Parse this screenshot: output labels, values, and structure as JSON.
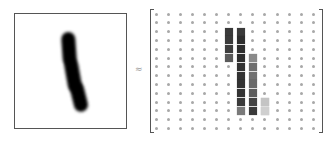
{
  "figure": {
    "left_panel": {
      "label": "handwritten digit image",
      "digit": "1"
    },
    "operator_symbol": "≈",
    "matrix": {
      "rows": 14,
      "cols": 14,
      "origin_x": 6,
      "origin_y": 5,
      "step_x": 12.1,
      "step_y": 8.8,
      "dot_color": "#a8a8a8",
      "cells": [
        {
          "r": 2,
          "c": 6,
          "shade": "#3a3a3a"
        },
        {
          "r": 2,
          "c": 7,
          "shade": "#3a3a3a"
        },
        {
          "r": 3,
          "c": 6,
          "shade": "#3a3a3a"
        },
        {
          "r": 3,
          "c": 7,
          "shade": "#2e2e2e"
        },
        {
          "r": 4,
          "c": 6,
          "shade": "#3d3d3d"
        },
        {
          "r": 4,
          "c": 7,
          "shade": "#2e2e2e"
        },
        {
          "r": 5,
          "c": 6,
          "shade": "#5a5a5a"
        },
        {
          "r": 5,
          "c": 7,
          "shade": "#2e2e2e"
        },
        {
          "r": 5,
          "c": 8,
          "shade": "#8a8a8a"
        },
        {
          "r": 6,
          "c": 7,
          "shade": "#333333"
        },
        {
          "r": 6,
          "c": 8,
          "shade": "#6e6e6e"
        },
        {
          "r": 7,
          "c": 7,
          "shade": "#333333"
        },
        {
          "r": 7,
          "c": 8,
          "shade": "#707070"
        },
        {
          "r": 8,
          "c": 7,
          "shade": "#333333"
        },
        {
          "r": 8,
          "c": 8,
          "shade": "#6a6a6a"
        },
        {
          "r": 9,
          "c": 7,
          "shade": "#333333"
        },
        {
          "r": 9,
          "c": 8,
          "shade": "#5e5e5e"
        },
        {
          "r": 10,
          "c": 7,
          "shade": "#3a3a3a"
        },
        {
          "r": 10,
          "c": 8,
          "shade": "#444444"
        },
        {
          "r": 10,
          "c": 9,
          "shade": "#c4c4c4"
        },
        {
          "r": 11,
          "c": 7,
          "shade": "#7a7a7a"
        },
        {
          "r": 11,
          "c": 8,
          "shade": "#3a3a3a"
        },
        {
          "r": 11,
          "c": 9,
          "shade": "#cfcfcf"
        }
      ]
    }
  }
}
